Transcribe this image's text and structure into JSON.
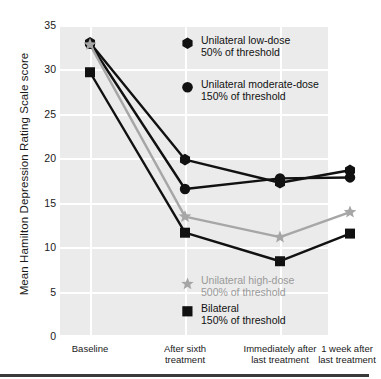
{
  "chart_data": {
    "type": "line",
    "title": "",
    "xlabel": "",
    "ylabel": "Mean Hamilton Depression Rating Scale score",
    "ylim": [
      0,
      35
    ],
    "yticks": [
      0,
      5,
      10,
      15,
      20,
      25,
      30,
      35
    ],
    "grid": true,
    "legend_position": "inside",
    "categories": [
      "Baseline",
      "After sixth treatment",
      "Immediately after last treatment",
      "1 week after last treatment"
    ],
    "series": [
      {
        "name": "Unilateral low-dose 50% of threshold",
        "marker": "hexagon",
        "color": "#111111",
        "values": [
          33.0,
          19.9,
          17.3,
          18.7
        ]
      },
      {
        "name": "Unilateral moderate-dose 150% of threshold",
        "marker": "circle",
        "color": "#111111",
        "values": [
          32.9,
          16.6,
          17.8,
          17.9
        ]
      },
      {
        "name": "Unilateral high-dose 500% of threshold",
        "marker": "star",
        "color": "#a6a6a6",
        "values": [
          32.8,
          13.5,
          11.2,
          14.0
        ]
      },
      {
        "name": "Bilateral 150% of threshold",
        "marker": "square",
        "color": "#111111",
        "values": [
          29.7,
          11.7,
          8.5,
          11.6
        ]
      }
    ]
  },
  "axes": {
    "y_title": "Mean Hamilton Depression Rating Scale score",
    "y_tick_labels": [
      "35",
      "30",
      "25",
      "20",
      "15",
      "10",
      "5",
      "0"
    ],
    "x_tick_labels": [
      [
        "Baseline"
      ],
      [
        "After sixth",
        "treatment"
      ],
      [
        "Immediately after",
        "last treatment"
      ],
      [
        "1 week after",
        "last treatment"
      ]
    ]
  },
  "legend": {
    "items": [
      {
        "marker": "hexagon-marker",
        "line1": "Unilateral low-dose",
        "line2": "50% of threshold",
        "color": "#111111"
      },
      {
        "marker": "circle-marker",
        "line1": "Unilateral moderate-dose",
        "line2": "150% of threshold",
        "color": "#111111"
      },
      {
        "marker": "star-marker",
        "line1": "Unilateral high-dose",
        "line2": "500% of threshold",
        "color": "#a6a6a6"
      },
      {
        "marker": "square-marker",
        "line1": "Bilateral",
        "line2": "150% of threshold",
        "color": "#111111"
      }
    ]
  },
  "colors": {
    "panel": "#ebebeb",
    "grid": "#ffffff",
    "dark": "#111111",
    "grey": "#a6a6a6",
    "rule": "#3a3a3a"
  }
}
